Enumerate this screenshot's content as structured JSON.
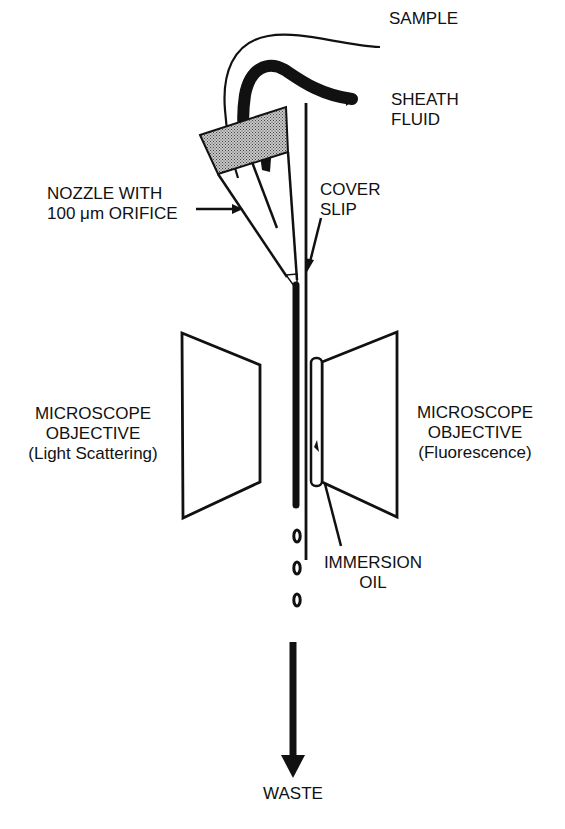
{
  "diagram": {
    "type": "flow cytometer schematic",
    "labels": {
      "sample": "SAMPLE",
      "sheath_line1": "SHEATH",
      "sheath_line2": "FLUID",
      "nozzle_line1": "NOZZLE WITH",
      "nozzle_line2": "100 μm ORIFICE",
      "cover_line1": "COVER",
      "cover_line2": "SLIP",
      "obj_left_line1": "MICROSCOPE",
      "obj_left_line2": "OBJECTIVE",
      "obj_left_line3": "(Light Scattering)",
      "obj_right_line1": "MICROSCOPE",
      "obj_right_line2": "OBJECTIVE",
      "obj_right_line3": "(Fluorescence)",
      "oil_line1": "IMMERSION",
      "oil_line2": "OIL",
      "waste": "WASTE"
    },
    "components": [
      "sample-tube",
      "sheath-fluid-tube",
      "nozzle",
      "cover-slip",
      "sample-stream",
      "droplets",
      "light-scattering-objective",
      "fluorescence-objective",
      "immersion-oil",
      "waste-arrow"
    ],
    "colors": {
      "ink": "#111111",
      "background": "#ffffff",
      "stipple": "#9a9a9a"
    }
  }
}
